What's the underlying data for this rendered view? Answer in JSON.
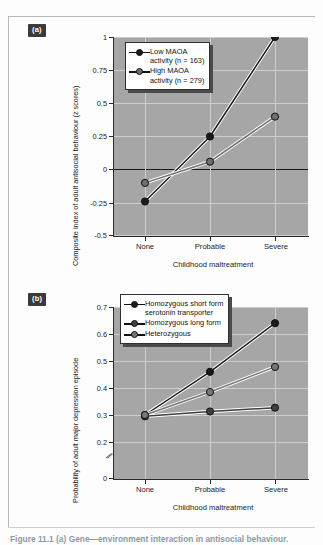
{
  "figure": {
    "panels": [
      {
        "tag": "(a)",
        "ylabel": "Composite index of adult antisocial behaviour (z scores)",
        "xlabel": "Childhood maltreatment",
        "xticks": [
          "None",
          "Probable",
          "Severe"
        ],
        "yticks": [
          "1",
          "0.75",
          "0.5",
          "0.25",
          "0",
          "-0.25",
          "-0.5"
        ],
        "legend": [
          {
            "label": "Low MAOA\nactivity (n = 163)",
            "color": "#1a1a1a"
          },
          {
            "label": "High MAOA\nactivity (n = 279)",
            "color": "#6e6e6e"
          }
        ]
      },
      {
        "tag": "(b)",
        "ylabel": "Probability of adult major depression episode",
        "xlabel": "Childhood maltreatment",
        "xticks": [
          "None",
          "Probable",
          "Severe"
        ],
        "yticks": [
          "0.7",
          "0.6",
          "0.5",
          "0.4",
          "0.3",
          "0.2",
          "0"
        ],
        "legend": [
          {
            "label": "Homozygous short form\nserotonin transporter",
            "color": "#1a1a1a"
          },
          {
            "label": "Homozygous long form",
            "color": "#3f3f3f"
          },
          {
            "label": "Heterozygous",
            "color": "#767676"
          }
        ]
      }
    ]
  },
  "caption": {
    "text": "Figure 11.1  (a) Gene—environment interaction in antisocial behaviour."
  },
  "chart_data": [
    {
      "type": "line",
      "title": "(a) MAOA activity and adult antisocial behaviour",
      "xlabel": "Childhood maltreatment",
      "ylabel": "Composite index of adult antisocial behaviour (z scores)",
      "categories": [
        "None",
        "Probable",
        "Severe"
      ],
      "ylim": [
        -0.5,
        1
      ],
      "yticks": [
        1,
        0.75,
        0.5,
        0.25,
        0,
        -0.25,
        -0.5
      ],
      "grid": true,
      "legend_position": "top-left",
      "series": [
        {
          "name": "Low MAOA activity (n = 163)",
          "values": [
            -0.24,
            0.25,
            1.0
          ],
          "color": "#1a1a1a",
          "marker": "circle"
        },
        {
          "name": "High MAOA activity (n = 279)",
          "values": [
            -0.1,
            0.06,
            0.4
          ],
          "color": "#6e6e6e",
          "marker": "circle"
        }
      ]
    },
    {
      "type": "line",
      "title": "(b) Serotonin transporter genotype and adult depression",
      "xlabel": "Childhood maltreatment",
      "ylabel": "Probability of adult major depression episode",
      "categories": [
        "None",
        "Probable",
        "Severe"
      ],
      "ylim": [
        0.2,
        0.7
      ],
      "yticks": [
        0.7,
        0.6,
        0.5,
        0.4,
        0.3,
        0.2,
        0
      ],
      "axis_break": "between 0.2 and 0",
      "grid": true,
      "legend_position": "top-left",
      "series": [
        {
          "name": "Homozygous short form serotonin transporter",
          "values": [
            0.3,
            0.46,
            0.64
          ],
          "color": "#1a1a1a",
          "marker": "circle"
        },
        {
          "name": "Homozygous long form",
          "values": [
            0.295,
            0.313,
            0.327
          ],
          "color": "#3f3f3f",
          "marker": "circle"
        },
        {
          "name": "Heterozygous",
          "values": [
            0.3,
            0.385,
            0.478
          ],
          "color": "#767676",
          "marker": "circle"
        }
      ]
    }
  ]
}
